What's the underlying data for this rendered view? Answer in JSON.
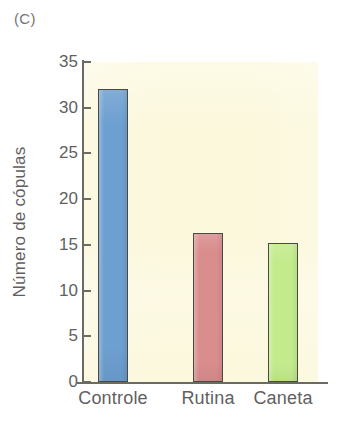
{
  "figure": {
    "panel_label": "(C)",
    "background_color": "#ffffff",
    "plot_background_color": "#fcf8dc",
    "axis_color": "#6b6b63",
    "text_color": "#5f5f5f"
  },
  "chart_data": {
    "type": "bar",
    "title": "",
    "subtitle": "",
    "xlabel": "",
    "ylabel": "Número de cópulas",
    "categories": [
      "Controle",
      "Rutina",
      "Caneta"
    ],
    "values": [
      32.0,
      16.3,
      15.2
    ],
    "bar_colors": [
      "#6d9fd0",
      "#d98d8d",
      "#c3eb8c"
    ],
    "bar_border_color": "#4a4a44",
    "ylim": [
      0,
      35
    ],
    "yticks": [
      0,
      5,
      10,
      15,
      20,
      25,
      30,
      35
    ],
    "ytick_labels": [
      "0",
      "5",
      "10",
      "15",
      "20",
      "25",
      "30",
      "35"
    ],
    "grid": false,
    "legend": false,
    "legend_position": "none",
    "annotations": [
      "(C)"
    ]
  }
}
